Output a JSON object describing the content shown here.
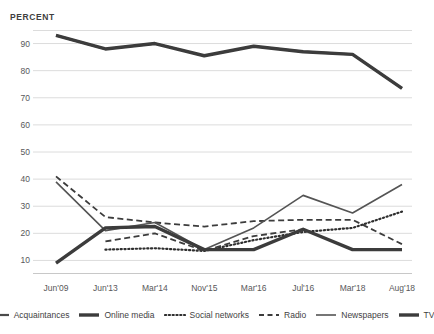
{
  "axis_title": "PERCENT",
  "yticks": [
    90,
    80,
    70,
    60,
    50,
    40,
    30,
    20,
    10
  ],
  "legend": [
    {
      "label": "Acquaintances",
      "style": "solid",
      "width": 2.2,
      "color": "#4a4a4a"
    },
    {
      "label": "Online media",
      "style": "solid",
      "width": 3.4,
      "color": "#3c3c3c"
    },
    {
      "label": "Social networks",
      "style": "dotted",
      "width": 2.2,
      "color": "#2e2e2e"
    },
    {
      "label": "Radio",
      "style": "dashed",
      "width": 1.8,
      "color": "#3c3c3c"
    },
    {
      "label": "Newspapers",
      "style": "solid",
      "width": 1.6,
      "color": "#545454"
    },
    {
      "label": "TV",
      "style": "solid",
      "width": 3.4,
      "color": "#3c3c3c"
    }
  ],
  "chart_data": {
    "type": "line",
    "title": "",
    "xlabel": "",
    "ylabel": "PERCENT",
    "ylim": [
      5,
      95
    ],
    "grid": true,
    "legend_position": "bottom",
    "categories": [
      "Jun'09",
      "Jun'13",
      "Mar'14",
      "Nov'15",
      "Mar'16",
      "Jul'16",
      "Mar'18",
      "Aug'18"
    ],
    "series": [
      {
        "name": "Acquaintances",
        "style": "solid",
        "values": [
          93,
          88,
          90,
          85.5,
          89,
          87,
          86,
          73.5
        ]
      },
      {
        "name": "Online media",
        "style": "solid",
        "values": [
          null,
          null,
          null,
          null,
          null,
          null,
          null,
          null
        ]
      },
      {
        "name": "Social networks",
        "style": "dotted",
        "values": [
          null,
          14,
          14.5,
          13.5,
          17.5,
          20.5,
          22,
          28
        ]
      },
      {
        "name": "Radio",
        "style": "dashed",
        "values": [
          41,
          26,
          24,
          22.5,
          24.5,
          25,
          25,
          16
        ]
      },
      {
        "name": "Newspapers",
        "style": "solid",
        "values": [
          39,
          21,
          24,
          14,
          22,
          34,
          27.5,
          38
        ]
      },
      {
        "name": "TV",
        "style": "solid",
        "values": [
          93,
          88,
          90,
          85.5,
          89,
          87,
          86,
          73.5
        ]
      }
    ],
    "extra_series": [
      {
        "name": "Online media",
        "style": "solid",
        "values": [
          9,
          22,
          22.5,
          14,
          14,
          21.5,
          14,
          14
        ]
      },
      {
        "name": "Radio-lower",
        "style": "dashed",
        "values": [
          null,
          17,
          20,
          13.5,
          19,
          21.5,
          14,
          14
        ]
      }
    ]
  }
}
